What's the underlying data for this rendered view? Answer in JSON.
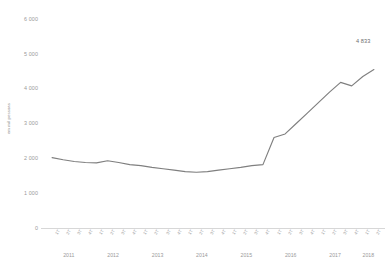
{
  "axis": {
    "y_title": "em mil pessoas",
    "y_ticks": [
      "6 000",
      "5 000",
      "4 000",
      "3 000",
      "2 000",
      "1 000",
      "0"
    ]
  },
  "annotation": {
    "last_value_label": "4 833"
  },
  "colors": {
    "line": "#7f7f7f",
    "axis": "#d7d7d7",
    "text": "#9a9a9a"
  },
  "chart_data": {
    "type": "line",
    "title": "",
    "subtitle": "",
    "xlabel": "",
    "ylabel": "em mil pessoas",
    "ylim": [
      0,
      6000
    ],
    "ytick_values": [
      0,
      1000,
      2000,
      3000,
      4000,
      5000,
      6000
    ],
    "ytick_labels": [
      "0",
      "1 000",
      "2 000",
      "3 000",
      "4 000",
      "5 000",
      "6 000"
    ],
    "grid": false,
    "legend": false,
    "legend_position": "none",
    "year_groups": [
      {
        "year": "2011",
        "quarters": [
          "1T",
          "2T",
          "3T",
          "4T"
        ]
      },
      {
        "year": "2012",
        "quarters": [
          "1T",
          "2T",
          "3T",
          "4T"
        ]
      },
      {
        "year": "2013",
        "quarters": [
          "1T",
          "2T",
          "3T",
          "4T"
        ]
      },
      {
        "year": "2014",
        "quarters": [
          "1T",
          "2T",
          "3T",
          "4T"
        ]
      },
      {
        "year": "2015",
        "quarters": [
          "1T",
          "2T",
          "3T",
          "4T"
        ]
      },
      {
        "year": "2016",
        "quarters": [
          "1T",
          "2T",
          "3T",
          "4T"
        ]
      },
      {
        "year": "2017",
        "quarters": [
          "1T",
          "2T",
          "3T",
          "4T"
        ]
      },
      {
        "year": "2018",
        "quarters": [
          "1T",
          "2T"
        ]
      }
    ],
    "categories": [
      "1T 2011",
      "2T 2011",
      "3T 2011",
      "4T 2011",
      "1T 2012",
      "2T 2012",
      "3T 2012",
      "4T 2012",
      "1T 2013",
      "2T 2013",
      "3T 2013",
      "4T 2013",
      "1T 2014",
      "2T 2014",
      "3T 2014",
      "4T 2014",
      "1T 2015",
      "2T 2015",
      "3T 2015",
      "4T 2015",
      "1T 2016",
      "2T 2016",
      "3T 2016",
      "4T 2016",
      "1T 2017",
      "2T 2017",
      "3T 2017",
      "4T 2017",
      "1T 2018",
      "2T 2018"
    ],
    "xtick_labels": [
      "1T",
      "2T",
      "3T",
      "4T",
      "1T",
      "2T",
      "3T",
      "4T",
      "1T",
      "2T",
      "3T",
      "4T",
      "1T",
      "2T",
      "3T",
      "4T",
      "1T",
      "2T",
      "3T",
      "4T",
      "1T",
      "2T",
      "3T",
      "4T",
      "1T",
      "2T",
      "3T",
      "4T",
      "1T",
      "2T"
    ],
    "values": [
      2020,
      1960,
      1910,
      1880,
      1870,
      1930,
      1880,
      1820,
      1790,
      1740,
      1700,
      1660,
      1620,
      1600,
      1620,
      1660,
      1700,
      1740,
      1790,
      1820,
      2600,
      2700,
      3000,
      3300,
      3600,
      3900,
      4180,
      4080,
      4350,
      4550
    ],
    "data_labels": {
      "2T 2018": "4 833"
    },
    "last_point_value": 4833
  }
}
